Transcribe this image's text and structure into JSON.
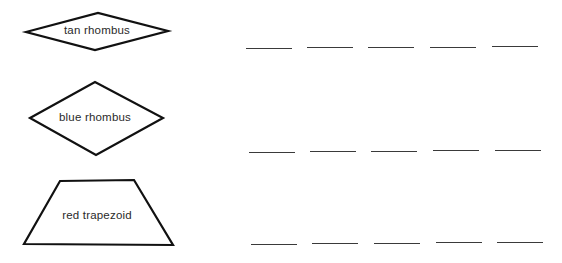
{
  "shapes": [
    {
      "name": "tan-rhombus",
      "label": "tan rhombus",
      "type": "rhombus",
      "points": "26,32 98,13 168,31 95,50",
      "label_x": 97,
      "label_y": 30
    },
    {
      "name": "blue-rhombus",
      "label": "blue rhombus",
      "type": "rhombus",
      "points": "30,118 95,82 163,118 96,155",
      "label_x": 95,
      "label_y": 117
    },
    {
      "name": "red-trapezoid",
      "label": "red trapezoid",
      "type": "trapezoid",
      "points": "60,181 134,180 173,245 24,244",
      "label_x": 97,
      "label_y": 215
    }
  ],
  "answer_rows": [
    {
      "row": 1,
      "y": 48,
      "blanks": [
        246,
        307,
        368,
        430,
        492
      ]
    },
    {
      "row": 2,
      "y": 152,
      "blanks": [
        249,
        310,
        371,
        433,
        495
      ]
    },
    {
      "row": 3,
      "y": 244,
      "blanks": [
        251,
        312,
        374,
        436,
        497
      ]
    }
  ],
  "colors": {
    "stroke": "#111111",
    "text": "#2a2a2a",
    "blank": "#3a3a3a"
  }
}
